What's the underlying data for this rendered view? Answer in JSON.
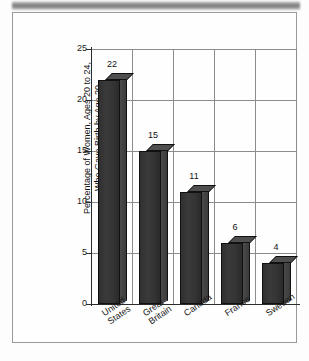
{
  "chart_data": {
    "type": "bar",
    "title": "",
    "subtitle": "",
    "xlabel": "",
    "ylabel": "Percentage of Women, Ages 20 to 24,\nWho Gave Birth by Age 20",
    "ylabel_line1": "Percentage of Women, Ages 20 to 24,",
    "ylabel_line2": "Who Gave Birth by Age 20",
    "categories": [
      "United States",
      "Great Britain",
      "Canada",
      "France",
      "Sweden"
    ],
    "category_lines": [
      [
        "United",
        "States"
      ],
      [
        "Great",
        "Britain"
      ],
      [
        "Canada"
      ],
      [
        "France"
      ],
      [
        "Sweden"
      ]
    ],
    "values": [
      22,
      15,
      11,
      6,
      4
    ],
    "value_labels": [
      "22",
      "15",
      "11",
      "6",
      "4"
    ],
    "ylim": [
      0,
      25
    ],
    "ytick_values": [
      0,
      5,
      10,
      15,
      20,
      25
    ],
    "ytick_labels": [
      "0",
      "5",
      "10",
      "15",
      "20",
      "25"
    ],
    "grid": "horizontal-and-vertical",
    "legend": "none",
    "style": "3d-bars-grayscale"
  },
  "colors": {
    "bar_front": "#343434",
    "bar_side": "#424242",
    "bar_top": "#4f4f4f",
    "gridline": "#8c8c8c",
    "axis": "#2b2b2b",
    "frame_border": "#9a9a9a",
    "background": "#fefefe",
    "banner": "#7d7d7d"
  }
}
